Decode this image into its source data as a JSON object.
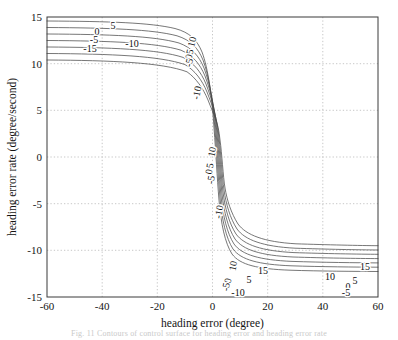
{
  "figure": {
    "caption_partial": "Fig. 11  Contours of control surface for heading error and heading error rate"
  },
  "chart_data": {
    "type": "line",
    "subtype": "contour",
    "title": "",
    "xlabel": "heading error (degree)",
    "ylabel": "heading error rate (degree/second)",
    "xlim": [
      -60,
      60
    ],
    "ylim": [
      -15,
      15
    ],
    "xticks": [
      -60,
      -40,
      -20,
      0,
      20,
      40,
      60
    ],
    "yticks": [
      -15,
      -10,
      -5,
      0,
      5,
      10,
      15
    ],
    "xticklabels": [
      "-60",
      "-40",
      "-20",
      "0",
      "20",
      "40",
      "60"
    ],
    "yticklabels": [
      "-15",
      "-10",
      "-5",
      "0",
      "5",
      "10",
      "15"
    ],
    "grid": true,
    "grid_style": "dotted",
    "legend": "none",
    "contour_levels": [
      -15,
      -10,
      -5,
      0,
      5,
      10,
      15
    ],
    "labels": [
      {
        "text": "5",
        "x": 113,
        "y": 27,
        "rotate": 0
      },
      {
        "text": "0",
        "x": 97,
        "y": 33,
        "rotate": 0
      },
      {
        "text": "-5",
        "x": 94,
        "y": 41,
        "rotate": 0
      },
      {
        "text": "-10",
        "x": 132,
        "y": 45,
        "rotate": 0
      },
      {
        "text": "-15",
        "x": 90,
        "y": 50,
        "rotate": 0
      },
      {
        "text": "10",
        "x": 193,
        "y": 42,
        "rotate": -76
      },
      {
        "text": "5",
        "x": 191,
        "y": 52,
        "rotate": -76
      },
      {
        "text": "0",
        "x": 190,
        "y": 57,
        "rotate": -76
      },
      {
        "text": "-5",
        "x": 190,
        "y": 63,
        "rotate": -76
      },
      {
        "text": "-10",
        "x": 198,
        "y": 93,
        "rotate": -78
      },
      {
        "text": "10",
        "x": 213,
        "y": 152,
        "rotate": -80
      },
      {
        "text": "5",
        "x": 211,
        "y": 166,
        "rotate": -80
      },
      {
        "text": "0",
        "x": 210,
        "y": 172,
        "rotate": -80
      },
      {
        "text": "-5",
        "x": 212,
        "y": 180,
        "rotate": -80
      },
      {
        "text": "-10",
        "x": 220,
        "y": 212,
        "rotate": -80
      },
      {
        "text": "10",
        "x": 234,
        "y": 266,
        "rotate": -80
      },
      {
        "text": "15",
        "x": 263,
        "y": 272,
        "rotate": 0
      },
      {
        "text": "15",
        "x": 365,
        "y": 268,
        "rotate": 0
      },
      {
        "text": "5",
        "x": 249,
        "y": 281,
        "rotate": 0
      },
      {
        "text": "0",
        "x": 229,
        "y": 281,
        "rotate": -80
      },
      {
        "text": "-5",
        "x": 227,
        "y": 287,
        "rotate": -80
      },
      {
        "text": "10",
        "x": 330,
        "y": 278,
        "rotate": 0
      },
      {
        "text": "5",
        "x": 355,
        "y": 282,
        "rotate": 0
      },
      {
        "text": "0",
        "x": 348,
        "y": 288,
        "rotate": 0
      },
      {
        "text": "-5",
        "x": 346,
        "y": 294,
        "rotate": 0
      },
      {
        "text": "-10",
        "x": 238,
        "y": 294,
        "rotate": 0
      }
    ]
  }
}
